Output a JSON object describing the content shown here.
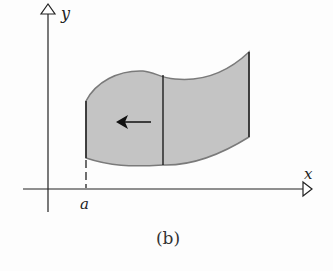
{
  "figure": {
    "caption": "(b)",
    "labels": {
      "x_axis": "x",
      "y_axis": "y",
      "a_mark": "a"
    },
    "colors": {
      "region_fill": "#c4c4c4",
      "region_stroke": "#7a7a7a",
      "ink": "#111111"
    }
  }
}
